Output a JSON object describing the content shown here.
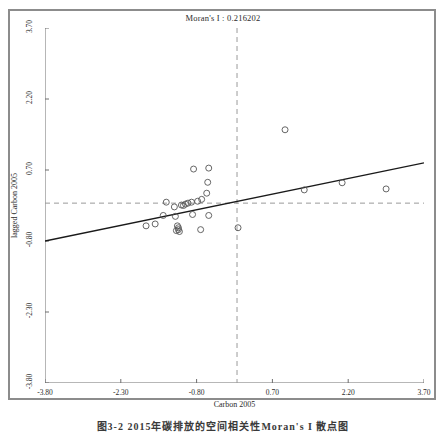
{
  "figure": {
    "title": "Moran's I : 0.216202",
    "caption": "图3-2  2015年碳排放的空间相关性Moran's I 散点图"
  },
  "chart_data": {
    "type": "scatter",
    "title": "Moran's I : 0.216202",
    "xlabel": "Carbon 2005",
    "ylabel": "lagged Carbon 2005",
    "xlim": [
      -3.8,
      3.7
    ],
    "ylim": [
      -3.8,
      3.7
    ],
    "xticks": [
      "-3.80",
      "-2.30",
      "-0.80",
      "0.70",
      "2.20",
      "3.70"
    ],
    "yticks": [
      "-3.80",
      "-2.30",
      "-0.80",
      "0.70",
      "2.20",
      "3.70"
    ],
    "xtick_values": [
      -3.8,
      -2.3,
      -0.8,
      0.7,
      2.2,
      3.7
    ],
    "ytick_values": [
      -3.8,
      -2.3,
      -0.8,
      0.7,
      2.2,
      3.7
    ],
    "grid": false,
    "legend": "none",
    "morans_i": 0.216202,
    "reference_lines": {
      "horizontal_y": 0.0,
      "vertical_x": 0.0,
      "style": "dashed",
      "color": "#9a9a9a"
    },
    "fit_line": {
      "x": [
        -3.8,
        3.7
      ],
      "y": [
        -0.8,
        0.85
      ],
      "slope": 0.2162,
      "color": "#1a1a1a"
    },
    "marker": {
      "shape": "circle-open",
      "color": "#555555",
      "size": 3
    },
    "points": [
      {
        "x": -0.86,
        "y": 0.72
      },
      {
        "x": -0.56,
        "y": 0.74
      },
      {
        "x": -0.58,
        "y": 0.44
      },
      {
        "x": -0.6,
        "y": 0.21
      },
      {
        "x": -0.7,
        "y": 0.08
      },
      {
        "x": -0.78,
        "y": 0.04
      },
      {
        "x": -0.9,
        "y": 0.02
      },
      {
        "x": -0.97,
        "y": 0.0
      },
      {
        "x": -1.02,
        "y": -0.02
      },
      {
        "x": -1.06,
        "y": -0.05
      },
      {
        "x": -1.1,
        "y": -0.04
      },
      {
        "x": -1.24,
        "y": -0.08
      },
      {
        "x": -1.46,
        "y": -0.26
      },
      {
        "x": -1.22,
        "y": -0.28
      },
      {
        "x": -0.88,
        "y": -0.24
      },
      {
        "x": -0.56,
        "y": -0.26
      },
      {
        "x": -1.8,
        "y": -0.48
      },
      {
        "x": -1.62,
        "y": -0.44
      },
      {
        "x": -1.18,
        "y": -0.48
      },
      {
        "x": -1.16,
        "y": -0.52
      },
      {
        "x": -1.16,
        "y": -0.56
      },
      {
        "x": -1.2,
        "y": -0.58
      },
      {
        "x": -1.14,
        "y": -0.6
      },
      {
        "x": -0.72,
        "y": -0.56
      },
      {
        "x": 0.02,
        "y": -0.52
      },
      {
        "x": 0.95,
        "y": 1.55
      },
      {
        "x": 1.33,
        "y": 0.28
      },
      {
        "x": 2.08,
        "y": 0.43
      },
      {
        "x": 2.95,
        "y": 0.3
      },
      {
        "x": -1.4,
        "y": 0.02
      }
    ]
  }
}
